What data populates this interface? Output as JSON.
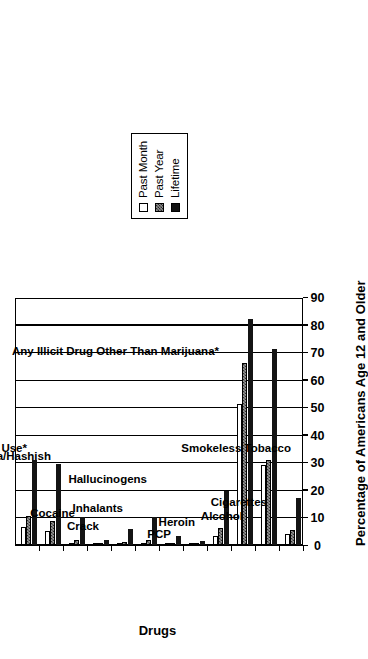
{
  "chart_data": {
    "type": "bar",
    "orientation": "vertical",
    "title": "",
    "xlabel": "Drugs",
    "ylabel": "Percentage of Americans Age 12 and Older",
    "ylim": [
      0,
      90
    ],
    "ytick_step": 10,
    "yticks": [
      0,
      10,
      20,
      30,
      40,
      50,
      60,
      70,
      80,
      90
    ],
    "grid": true,
    "legend_position": "above-plot",
    "categories": [
      "Any Illicit Drug Use*",
      "Marijuana/Hashish",
      "Cocaine",
      "Crack",
      "Inhalants",
      "Hallucinogens",
      "PCP",
      "Heroin",
      "Any Illicit Drug Other Than Marijuana*",
      "Alcohol",
      "Cigarettes",
      "Smokeless Tobacco"
    ],
    "series": [
      {
        "name": "Past Month",
        "fill": "white",
        "values": [
          6.4,
          5.0,
          0.8,
          0.2,
          0.4,
          0.5,
          0.1,
          0.1,
          3.1,
          51.0,
          29.0,
          4.0
        ]
      },
      {
        "name": "Past Year",
        "fill": "hatched",
        "values": [
          10.6,
          8.6,
          1.8,
          0.5,
          1.1,
          1.7,
          0.2,
          0.2,
          6.2,
          66.0,
          31.0,
          5.4
        ]
      },
      {
        "name": "Lifetime",
        "fill": "black",
        "values": [
          31.0,
          29.5,
          10.3,
          1.8,
          5.9,
          10.0,
          3.1,
          1.3,
          19.5,
          82.0,
          71.0,
          17.0
        ]
      }
    ]
  },
  "legend": {
    "entries": [
      {
        "label": "Past Month",
        "swatch": "white-square-icon"
      },
      {
        "label": "Past Year",
        "swatch": "hatched-square-icon"
      },
      {
        "label": "Lifetime",
        "swatch": "black-square-icon"
      }
    ]
  },
  "axes": {
    "value_axis_title": "Percentage of Americans Age 12 and Older",
    "category_axis_title": "Drugs",
    "tick_labels": [
      "0",
      "10",
      "20",
      "30",
      "40",
      "50",
      "60",
      "70",
      "80",
      "90"
    ]
  }
}
